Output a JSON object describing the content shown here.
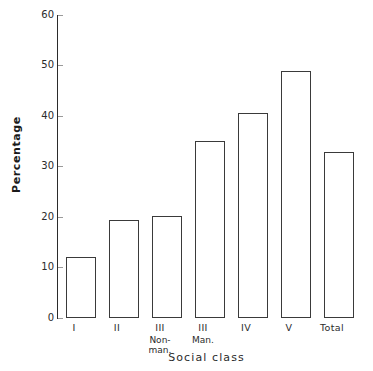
{
  "chart_data": {
    "type": "bar",
    "title": "",
    "xlabel": "Social class",
    "ylabel": "Percentage",
    "ylim": [
      0,
      60
    ],
    "ytick_step": 10,
    "grid": false,
    "legend": null,
    "categories": [
      "I",
      "II",
      "III Non-man.",
      "III Man.",
      "IV",
      "V",
      "Total"
    ],
    "category_labels": [
      {
        "main": "I",
        "sub": ""
      },
      {
        "main": "II",
        "sub": ""
      },
      {
        "main": "III",
        "sub": "Non-\nman."
      },
      {
        "main": "III",
        "sub": "Man."
      },
      {
        "main": "IV",
        "sub": ""
      },
      {
        "main": "V",
        "sub": ""
      },
      {
        "main": "Total",
        "sub": ""
      }
    ],
    "values": [
      12.1,
      19.5,
      20.2,
      35.0,
      40.6,
      48.9,
      32.9
    ],
    "yticks": [
      "0",
      "10",
      "20",
      "30",
      "40",
      "50",
      "60"
    ],
    "colors": {
      "bar_fill": "#ffffff",
      "bar_stroke": "#3a3a3a",
      "axis": "#2b2b2b",
      "text": "#2b2b2b",
      "background": "#ffffff"
    }
  },
  "axis": {
    "y_title": "Percentage",
    "x_title": "Social class"
  },
  "ticks": {
    "t0": "0",
    "t1": "10",
    "t2": "20",
    "t3": "30",
    "t4": "40",
    "t5": "50",
    "t6": "60"
  },
  "xlabels": {
    "c0_main": "I",
    "c0_sub": "",
    "c1_main": "II",
    "c1_sub": "",
    "c2_main": "III",
    "c2_sub": "Non-",
    "c2_sub2": "man.",
    "c3_main": "III",
    "c3_sub": "Man.",
    "c4_main": "IV",
    "c4_sub": "",
    "c5_main": "V",
    "c5_sub": "",
    "c6_main": "Total",
    "c6_sub": ""
  }
}
